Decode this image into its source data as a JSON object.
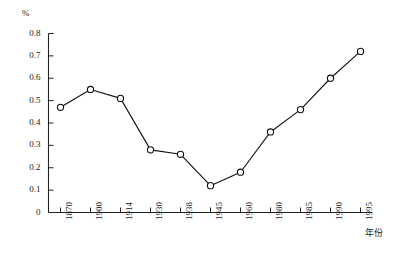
{
  "chart_data": {
    "type": "line",
    "title": "",
    "subtitle": "",
    "xlabel": "年份",
    "ylabel": "",
    "unit_label": "%",
    "categories": [
      "1870",
      "1900",
      "1914",
      "1930",
      "1938",
      "1945",
      "1960",
      "1980",
      "1985",
      "1990",
      "1995"
    ],
    "values": [
      0.47,
      0.55,
      0.51,
      0.28,
      0.26,
      0.12,
      0.18,
      0.36,
      0.46,
      0.6,
      0.72
    ],
    "series": [
      {
        "name": "",
        "values": [
          0.47,
          0.55,
          0.51,
          0.28,
          0.26,
          0.12,
          0.18,
          0.36,
          0.46,
          0.6,
          0.72
        ]
      }
    ],
    "ylim": [
      0,
      0.8
    ],
    "yticks": [
      "0",
      "0.1",
      "0.2",
      "0.3",
      "0.4",
      "0.5",
      "0.6",
      "0.7",
      "0.8"
    ],
    "ytick_values": [
      0,
      0.1,
      0.2,
      0.3,
      0.4,
      0.5,
      0.6,
      0.7,
      0.8
    ],
    "grid": false,
    "legend": "none",
    "marker": "open-circle",
    "line_color": "#111111",
    "marker_fill": "#ffffff",
    "axis_color": "#222222",
    "background": "#ffffff"
  }
}
